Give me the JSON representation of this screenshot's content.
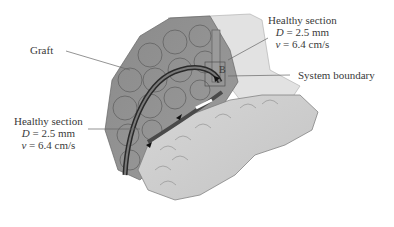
{
  "figure": {
    "labels": {
      "graft": "Graft",
      "point_b": "B",
      "system_boundary": "System boundary",
      "healthy_top": {
        "title": "Healthy section",
        "d_symbol": "D",
        "d_value": " = 2.5 mm",
        "v_symbol": "v",
        "v_value": " = 6.4 cm/s"
      },
      "healthy_left": {
        "title": "Healthy section",
        "d_symbol": "D",
        "d_value": " = 2.5 mm",
        "v_symbol": "v",
        "v_value": " = 6.4 cm/s"
      }
    }
  }
}
